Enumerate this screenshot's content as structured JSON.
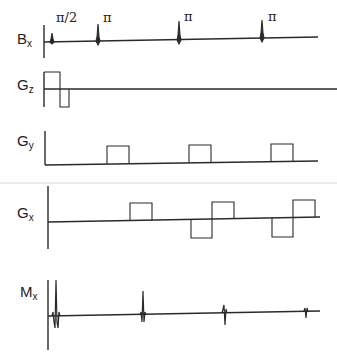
{
  "diagram": {
    "type": "pulse-sequence",
    "title": "",
    "rows": [
      {
        "id": "bx",
        "label_main": "B",
        "label_sub": "x",
        "pulses": [
          {
            "label": "π/2",
            "x": 52,
            "top": 33
          },
          {
            "label": "π",
            "x": 98,
            "top": 24
          },
          {
            "label": "π",
            "x": 179,
            "top": 21
          },
          {
            "label": "π",
            "x": 262,
            "top": 20
          }
        ]
      },
      {
        "id": "gz",
        "label_main": "G",
        "label_sub": "z",
        "lobes": [
          {
            "x0": 44,
            "x1": 60,
            "polarity": "positive"
          },
          {
            "x0": 60,
            "x1": 69,
            "polarity": "negative"
          }
        ]
      },
      {
        "id": "gy",
        "label_main": "G",
        "label_sub": "y",
        "lobes": [
          {
            "x0": 107,
            "x1": 129,
            "polarity": "positive"
          },
          {
            "x0": 189,
            "x1": 211,
            "polarity": "positive"
          },
          {
            "x0": 271,
            "x1": 293,
            "polarity": "positive"
          }
        ]
      },
      {
        "id": "gx",
        "label_main": "G",
        "label_sub": "x",
        "lobes": [
          {
            "x0": 130,
            "x1": 152,
            "polarity": "positive"
          },
          {
            "x0": 191,
            "x1": 212,
            "polarity": "negative"
          },
          {
            "x0": 212,
            "x1": 234,
            "polarity": "positive"
          },
          {
            "x0": 272,
            "x1": 293,
            "polarity": "negative"
          },
          {
            "x0": 293,
            "x1": 315,
            "polarity": "positive"
          }
        ]
      },
      {
        "id": "mx",
        "label_main": "M",
        "label_sub": "x",
        "echoes": [
          {
            "x": 55,
            "amplitude": "large"
          },
          {
            "x": 143,
            "amplitude": "medium"
          },
          {
            "x": 225,
            "amplitude": "small"
          },
          {
            "x": 306,
            "amplitude": "smallest"
          }
        ]
      }
    ]
  },
  "colors": {
    "line": "#2a2a2a",
    "separator": "#ececec",
    "background": "#ffffff"
  }
}
